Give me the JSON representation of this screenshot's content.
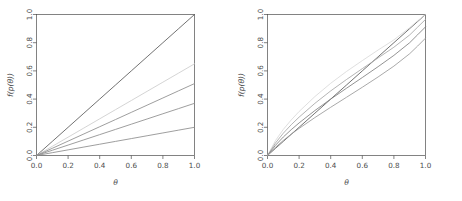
{
  "figure": {
    "background": "#ffffff",
    "axis_color": "#4d4d4d",
    "panel_count": 2
  },
  "chart_data": [
    {
      "type": "line",
      "panel": "left",
      "title": "",
      "xlabel": "θ",
      "ylabel": "f(p(θ))",
      "xlim": [
        0,
        1
      ],
      "ylim": [
        0,
        1
      ],
      "xticks": [
        0.0,
        0.2,
        0.4,
        0.6,
        0.8,
        1.0
      ],
      "yticks": [
        0.0,
        0.2,
        0.4,
        0.6,
        0.8,
        1.0
      ],
      "xticklabels": [
        "0.0",
        "0.2",
        "0.4",
        "0.6",
        "0.8",
        "1.0"
      ],
      "yticklabels": [
        "0.0",
        "0.2",
        "0.4",
        "0.6",
        "0.8",
        "1.0"
      ],
      "grid": false,
      "legend": "none",
      "x": [
        0.0,
        0.1,
        0.2,
        0.3,
        0.4,
        0.5,
        0.6,
        0.7,
        0.8,
        0.9,
        1.0
      ],
      "series": [
        {
          "name": "line-1",
          "color": "#595959",
          "values": [
            0.0,
            0.1,
            0.2,
            0.3,
            0.4,
            0.5,
            0.6,
            0.7,
            0.8,
            0.9,
            1.0
          ]
        },
        {
          "name": "line-2",
          "color": "#cccccc",
          "values": [
            0.0,
            0.065,
            0.13,
            0.195,
            0.26,
            0.325,
            0.39,
            0.455,
            0.52,
            0.585,
            0.65
          ]
        },
        {
          "name": "line-3",
          "color": "#8c8c8c",
          "values": [
            0.0,
            0.051,
            0.102,
            0.153,
            0.204,
            0.255,
            0.306,
            0.357,
            0.408,
            0.459,
            0.51
          ]
        },
        {
          "name": "line-4",
          "color": "#8c8c8c",
          "values": [
            0.0,
            0.037,
            0.074,
            0.111,
            0.148,
            0.185,
            0.222,
            0.259,
            0.296,
            0.333,
            0.37
          ]
        },
        {
          "name": "line-5",
          "color": "#8c8c8c",
          "values": [
            0.0,
            0.02,
            0.04,
            0.06,
            0.08,
            0.1,
            0.12,
            0.14,
            0.16,
            0.18,
            0.2
          ]
        }
      ]
    },
    {
      "type": "line",
      "panel": "right",
      "title": "",
      "xlabel": "θ",
      "ylabel": "f(p(θ))",
      "xlim": [
        0,
        1
      ],
      "ylim": [
        0,
        1
      ],
      "xticks": [
        0.0,
        0.2,
        0.4,
        0.6,
        0.8,
        1.0
      ],
      "yticks": [
        0.0,
        0.2,
        0.4,
        0.6,
        0.8,
        1.0
      ],
      "xticklabels": [
        "0.0",
        "0.2",
        "0.4",
        "0.6",
        "0.8",
        "1.0"
      ],
      "yticklabels": [
        "0.0",
        "0.2",
        "0.4",
        "0.6",
        "0.8",
        "1.0"
      ],
      "grid": false,
      "legend": "none",
      "x": [
        0.0,
        0.05,
        0.1,
        0.15,
        0.2,
        0.3,
        0.4,
        0.5,
        0.6,
        0.7,
        0.8,
        0.9,
        0.95,
        1.0
      ],
      "series": [
        {
          "name": "curve-1",
          "color": "#595959",
          "values": [
            0.0,
            0.05,
            0.1,
            0.15,
            0.2,
            0.3,
            0.4,
            0.5,
            0.6,
            0.7,
            0.8,
            0.9,
            0.95,
            1.0
          ]
        },
        {
          "name": "curve-2",
          "color": "#d9d9d9",
          "values": [
            0.0,
            0.105,
            0.185,
            0.252,
            0.312,
            0.418,
            0.512,
            0.596,
            0.673,
            0.748,
            0.82,
            0.907,
            0.955,
            1.0
          ]
        },
        {
          "name": "curve-3",
          "color": "#a6a6a6",
          "values": [
            0.0,
            0.088,
            0.158,
            0.218,
            0.272,
            0.37,
            0.458,
            0.539,
            0.616,
            0.692,
            0.768,
            0.855,
            0.91,
            0.965
          ]
        },
        {
          "name": "curve-4",
          "color": "#808080",
          "values": [
            0.0,
            0.072,
            0.131,
            0.183,
            0.231,
            0.319,
            0.4,
            0.477,
            0.553,
            0.63,
            0.71,
            0.8,
            0.856,
            0.912
          ]
        },
        {
          "name": "curve-5",
          "color": "#999999",
          "values": [
            0.0,
            0.058,
            0.107,
            0.151,
            0.192,
            0.269,
            0.342,
            0.413,
            0.484,
            0.557,
            0.634,
            0.722,
            0.776,
            0.832
          ]
        }
      ]
    }
  ]
}
